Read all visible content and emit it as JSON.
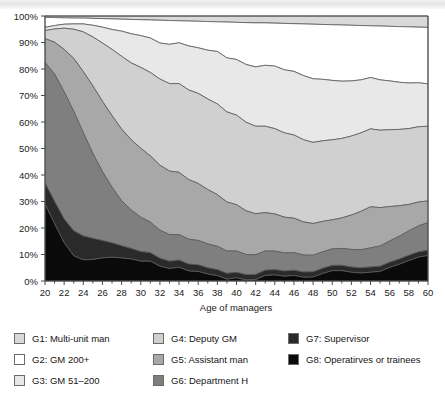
{
  "chart_data": {
    "type": "area",
    "stacked": true,
    "normalized": true,
    "title": "",
    "xlabel": "Age of managers",
    "ylabel": "",
    "xlim": [
      20,
      60
    ],
    "ylim": [
      0,
      100
    ],
    "grid": false,
    "legend_position": "bottom",
    "x": [
      20,
      21,
      22,
      23,
      24,
      25,
      26,
      27,
      28,
      29,
      30,
      31,
      32,
      33,
      34,
      35,
      36,
      37,
      38,
      39,
      40,
      41,
      42,
      43,
      44,
      45,
      46,
      47,
      48,
      49,
      50,
      51,
      52,
      53,
      54,
      55,
      56,
      57,
      58,
      59,
      60
    ],
    "xtick_labels": [
      "20",
      "22",
      "24",
      "26",
      "28",
      "30",
      "32",
      "34",
      "36",
      "38",
      "40",
      "42",
      "44",
      "46",
      "48",
      "50",
      "52",
      "54",
      "56",
      "58",
      "60"
    ],
    "ytick_labels": [
      "0%",
      "10%",
      "20%",
      "30%",
      "40%",
      "50%",
      "60%",
      "70%",
      "80%",
      "90%",
      "100%"
    ],
    "series": [
      {
        "name": "G1: Multi-unit man",
        "color": "#d9d9d9",
        "values": [
          0.5,
          0.6,
          0.7,
          0.8,
          0.8,
          0.9,
          1.0,
          1.1,
          1.2,
          1.3,
          1.4,
          1.5,
          1.6,
          1.7,
          1.8,
          1.9,
          2.0,
          2.1,
          2.2,
          2.3,
          2.4,
          2.5,
          2.6,
          2.6,
          2.7,
          2.8,
          2.9,
          3.0,
          3.1,
          3.2,
          3.3,
          3.4,
          3.5,
          3.6,
          3.7,
          3.8,
          3.9,
          4.0,
          4.1,
          4.2,
          4.3
        ]
      },
      {
        "name": "G2: GM 200+",
        "color": "#ffffff",
        "values": [
          3.8,
          3.0,
          2.4,
          2.2,
          2.2,
          2.6,
          3.2,
          4.0,
          4.5,
          5.4,
          6.0,
          6.8,
          8.6,
          9.0,
          8.3,
          9.4,
          10.0,
          10.8,
          11.2,
          13.5,
          14.0,
          15.8,
          16.6,
          16.0,
          16.2,
          17.5,
          18.0,
          19.5,
          20.6,
          20.7,
          21.0,
          21.2,
          21.0,
          20.5,
          19.5,
          20.3,
          20.6,
          21.0,
          21.2,
          21.0,
          21.3
        ]
      },
      {
        "name": "G3: GM 51–200",
        "color": "#e8e8e8",
        "values": [
          1.2,
          1.3,
          1.5,
          2.0,
          3.0,
          4.4,
          6.0,
          7.5,
          9.5,
          11.0,
          12.0,
          13.0,
          13.6,
          14.8,
          15.4,
          16.6,
          17.2,
          18.4,
          19.8,
          20.4,
          21.0,
          21.8,
          22.4,
          23.0,
          23.6,
          23.8,
          24.0,
          24.2,
          24.0,
          23.2,
          22.4,
          21.6,
          20.8,
          20.0,
          19.4,
          19.0,
          18.4,
          17.8,
          17.2,
          16.6,
          16.0
        ]
      },
      {
        "name": "G4: Deputy GM",
        "color": "#d0d0d0",
        "values": [
          3.0,
          5.0,
          8.0,
          11.0,
          15.0,
          18.5,
          22.0,
          25.0,
          27.5,
          29.0,
          30.5,
          31.5,
          32.5,
          33.0,
          33.5,
          33.8,
          34.0,
          34.2,
          34.2,
          34.0,
          33.8,
          33.4,
          33.0,
          32.6,
          32.2,
          31.8,
          31.4,
          31.0,
          30.6,
          30.4,
          30.2,
          30.0,
          29.8,
          29.6,
          29.4,
          29.2,
          29.0,
          28.8,
          28.6,
          28.4,
          28.2
        ]
      },
      {
        "name": "G5: Assistant man",
        "color": "#a8a8a8",
        "values": [
          9.0,
          12.0,
          16.0,
          20.0,
          23.0,
          25.5,
          26.5,
          27.0,
          27.0,
          26.5,
          26.0,
          25.0,
          24.5,
          24.0,
          23.5,
          22.5,
          21.5,
          20.5,
          19.5,
          18.5,
          17.5,
          16.5,
          15.5,
          14.5,
          14.0,
          13.5,
          13.0,
          12.5,
          12.0,
          11.5,
          11.0,
          11.5,
          13.0,
          14.5,
          15.5,
          14.5,
          13.0,
          11.5,
          10.0,
          9.0,
          8.2
        ]
      },
      {
        "name": "G6: Department H",
        "color": "#7f7f7f",
        "values": [
          45.5,
          48.0,
          48.0,
          45.0,
          39.0,
          32.0,
          26.0,
          21.0,
          17.0,
          14.5,
          13.0,
          11.5,
          10.6,
          10.0,
          9.6,
          9.4,
          9.2,
          9.0,
          8.8,
          8.4,
          8.0,
          7.6,
          7.4,
          7.2,
          7.0,
          6.8,
          6.6,
          6.4,
          6.2,
          6.2,
          6.2,
          6.4,
          6.6,
          6.8,
          7.2,
          7.6,
          8.0,
          8.6,
          9.2,
          9.8,
          10.4
        ]
      },
      {
        "name": "G7: Supervisor",
        "color": "#2a2a2a",
        "values": [
          8.0,
          8.5,
          9.0,
          9.5,
          9.0,
          8.0,
          6.6,
          5.4,
          4.6,
          4.0,
          3.6,
          3.2,
          3.0,
          2.8,
          2.7,
          2.6,
          2.5,
          2.4,
          2.3,
          2.2,
          2.1,
          2.0,
          2.0,
          2.0,
          2.0,
          2.0,
          2.0,
          2.0,
          2.0,
          2.0,
          2.0,
          2.0,
          2.0,
          2.0,
          2.0,
          2.0,
          2.0,
          2.0,
          2.0,
          2.0,
          2.0
        ]
      },
      {
        "name": "G8: Operatirves or trainees",
        "color": "#0a0a0a",
        "values": [
          29.0,
          21.6,
          14.4,
          9.5,
          8.0,
          8.1,
          8.7,
          9.0,
          8.7,
          8.3,
          7.5,
          7.5,
          6.2,
          4.7,
          5.2,
          3.8,
          3.6,
          2.6,
          2.0,
          0.7,
          1.2,
          0.4,
          0.5,
          2.1,
          2.3,
          1.8,
          2.1,
          1.4,
          1.5,
          2.8,
          3.9,
          3.9,
          4.3,
          4.0,
          3.3,
          3.6,
          5.1,
          6.3,
          7.7,
          9.0,
          9.6
        ]
      }
    ]
  },
  "legend": {
    "columns": [
      {
        "items": [
          {
            "label": "G1: Multi-unit man",
            "color": "#d9d9d9"
          },
          {
            "label": "G2: GM 200+",
            "color": "#ffffff"
          },
          {
            "label": "G3: GM 51–200",
            "color": "#e8e8e8"
          }
        ]
      },
      {
        "items": [
          {
            "label": "G4: Deputy GM",
            "color": "#d0d0d0"
          },
          {
            "label": "G5: Assistant man",
            "color": "#a8a8a8"
          },
          {
            "label": "G6: Department H",
            "color": "#7f7f7f"
          }
        ]
      },
      {
        "items": [
          {
            "label": "G7: Supervisor",
            "color": "#2a2a2a"
          },
          {
            "label": "G8: Operatirves or trainees",
            "color": "#0a0a0a"
          }
        ]
      }
    ]
  }
}
